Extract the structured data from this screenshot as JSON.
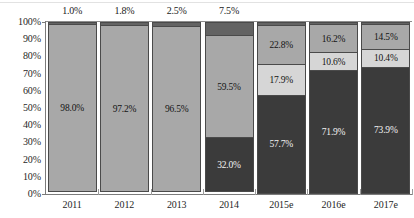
{
  "chart_data": {
    "type": "bar",
    "subtype": "stacked-percent-column",
    "title": "",
    "subtitle": "",
    "xlabel": "",
    "ylabel": "",
    "ylim": [
      0,
      100
    ],
    "y_tick_labels": [
      "100%",
      "90%",
      "80%",
      "70%",
      "60%",
      "50%",
      "40%",
      "30%",
      "20%",
      "10%",
      "0%"
    ],
    "y_tick_values": [
      100,
      90,
      80,
      70,
      60,
      50,
      40,
      30,
      20,
      10,
      0
    ],
    "grid": false,
    "legend": "none",
    "categories": [
      "2011",
      "2012",
      "2013",
      "2014",
      "2015e",
      "2016e",
      "2017e"
    ],
    "series": [
      {
        "name": "segment-1-bottom",
        "color": "#3b3b3b",
        "values": [
          0.0,
          0.0,
          0.0,
          32.0,
          57.7,
          71.9,
          73.9
        ],
        "labels": [
          "",
          "",
          "",
          "32.0%",
          "57.7%",
          "71.9%",
          "73.9%"
        ]
      },
      {
        "name": "segment-2",
        "color": "#d6d6d6",
        "values": [
          0.0,
          0.0,
          0.0,
          0.0,
          17.9,
          10.6,
          10.4
        ],
        "labels": [
          "",
          "",
          "",
          "",
          "17.9%",
          "10.6%",
          "10.4%"
        ]
      },
      {
        "name": "segment-3",
        "color": "#a8a8a8",
        "values": [
          98.0,
          97.2,
          96.5,
          59.5,
          22.8,
          16.2,
          14.5
        ],
        "labels": [
          "98.0%",
          "97.2%",
          "96.5%",
          "59.5%",
          "22.8%",
          "16.2%",
          "14.5%"
        ]
      },
      {
        "name": "segment-4-top",
        "color": "#636363",
        "values": [
          1.0,
          1.8,
          2.5,
          7.5,
          1.6,
          1.3,
          1.2
        ],
        "labels": [
          "",
          "",
          "",
          "",
          "",
          "",
          ""
        ]
      }
    ],
    "above_bar_labels": [
      "1.0%",
      "1.8%",
      "2.5%",
      "7.5%",
      "",
      "",
      ""
    ]
  },
  "axis": {
    "y_ticks": [
      {
        "label": "100%",
        "value": 100
      },
      {
        "label": "90%",
        "value": 90
      },
      {
        "label": "80%",
        "value": 80
      },
      {
        "label": "70%",
        "value": 70
      },
      {
        "label": "60%",
        "value": 60
      },
      {
        "label": "50%",
        "value": 50
      },
      {
        "label": "40%",
        "value": 40
      },
      {
        "label": "30%",
        "value": 30
      },
      {
        "label": "20%",
        "value": 20
      },
      {
        "label": "10%",
        "value": 10
      },
      {
        "label": "0%",
        "value": 0
      }
    ]
  },
  "colors": {
    "dark": "#3b3b3b",
    "light": "#d6d6d6",
    "medium": "#a8a8a8",
    "top": "#636363",
    "outline": "#4a4a4a",
    "axis": "#7b7b7b",
    "text": "#1f1f1f"
  }
}
